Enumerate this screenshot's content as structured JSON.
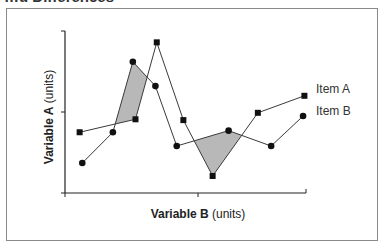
{
  "title": "…d Differences",
  "chart_data": {
    "type": "line",
    "title": "…d Differences",
    "xlabel": "Variable B (units)",
    "ylabel": "Variable A (units)",
    "xlabel_parts": {
      "bold": "Variable B",
      "normal": "(units)"
    },
    "ylabel_parts": {
      "bold": "Variable A",
      "normal": "(units)"
    },
    "xlim": [
      0,
      1.85
    ],
    "ylim": [
      0,
      2
    ],
    "x_ticks": [
      0,
      1
    ],
    "y_ticks": [
      0,
      1,
      2
    ],
    "tick_labels_shown": false,
    "grid": false,
    "legend_position": "inline-right",
    "series": [
      {
        "name": "Item A",
        "marker": "square",
        "points": [
          [
            0.11,
            0.75
          ],
          [
            0.53,
            0.91
          ],
          [
            0.69,
            1.86
          ],
          [
            0.89,
            0.9
          ],
          [
            1.11,
            0.21
          ],
          [
            1.45,
            0.99
          ],
          [
            1.8,
            1.2
          ]
        ]
      },
      {
        "name": "Item B",
        "marker": "circle",
        "points": [
          [
            0.13,
            0.37
          ],
          [
            0.36,
            0.75
          ],
          [
            0.51,
            1.62
          ],
          [
            0.68,
            1.32
          ],
          [
            0.84,
            0.58
          ],
          [
            1.23,
            0.77
          ],
          [
            1.55,
            0.58
          ],
          [
            1.79,
            0.95
          ]
        ]
      }
    ],
    "shaded_regions": [
      {
        "description": "Item B above Item A between first and second crossings",
        "color": "#b8b8b8"
      },
      {
        "description": "Item A below Item B between third and fourth crossings",
        "color": "#b8b8b8"
      }
    ],
    "annotations": []
  },
  "colors": {
    "line": "#3a3a3a",
    "marker": "#111111",
    "shade": "#b8b8b8",
    "frame": "#8a8a8a",
    "axis": "#222222"
  }
}
